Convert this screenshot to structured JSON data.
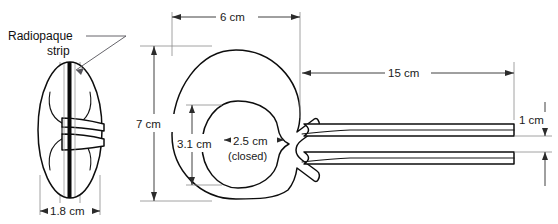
{
  "figure": {
    "background_color": "#ffffff",
    "line_color": "#0d0d0d",
    "text_color": "#1a1a1a",
    "dimension_line_color": "#2b2b2b",
    "extension_line_color": "#8a8a8a"
  },
  "annotations": {
    "radiopaque_line1": "Radiopaque",
    "radiopaque_line2": "strip"
  },
  "dimensions": {
    "side_width": "1.8 cm",
    "overall_width": "6 cm",
    "overall_height": "7 cm",
    "inner_height": "3.1 cm",
    "inner_width": "2.5 cm",
    "inner_width_note": "(closed)",
    "tube_length": "15 cm",
    "tube_gap": "1 cm"
  },
  "views": {
    "side_view_name": "side-profile-view",
    "front_view_name": "front-plan-view"
  }
}
